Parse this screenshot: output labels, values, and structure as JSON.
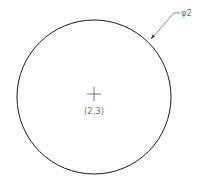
{
  "drawing": {
    "circle": {
      "cx": 94,
      "cy": 97,
      "r": 77,
      "stroke": "#1a1a1a"
    },
    "center_label": "(2,3)",
    "dimension_label": "φ2",
    "line_color": "#1a1a1a",
    "text_color": "#777777"
  }
}
